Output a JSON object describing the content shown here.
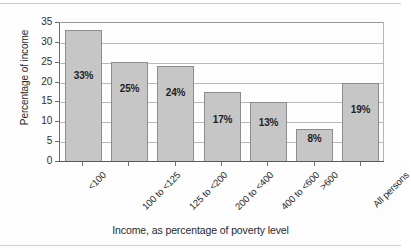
{
  "chart_data": {
    "type": "bar",
    "title": "",
    "xlabel": "Income, as percentage of poverty level",
    "ylabel": "Percentage of income",
    "categories": [
      "<100",
      "100 to <125",
      "125 to <200",
      "200 to <400",
      "400 to <600",
      ">600",
      "All persons"
    ],
    "values": [
      33,
      25,
      24,
      17,
      13,
      8,
      19
    ],
    "bar_tops": [
      33.3,
      25.1,
      24.1,
      17.5,
      15.2,
      8.3,
      19.8
    ],
    "data_labels": [
      "33%",
      "25%",
      "24%",
      "17%",
      "13%",
      "8%",
      "19%"
    ],
    "ylim": [
      0,
      35
    ],
    "yticks": [
      0,
      5,
      10,
      15,
      20,
      25,
      30,
      35
    ],
    "ytick_labels": [
      "0",
      "5",
      "10",
      "15",
      "20",
      "25",
      "30",
      "35"
    ],
    "grid": true,
    "grid_axis": "y",
    "legend": false,
    "legend_position": "none",
    "bar_color": "#c6c6c6",
    "bar_edge_color": "#8c8c8c",
    "axis_color": "#5c5c5c",
    "grid_color": "#b9b9b9",
    "text_color": "#2a2a2a"
  }
}
